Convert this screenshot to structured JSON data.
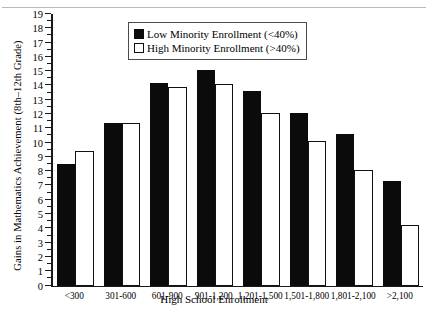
{
  "chart_data": {
    "type": "bar",
    "title": "",
    "xlabel": "High School Enrollment",
    "ylabel": "Gains in Mathematics Achievement (8th–12th Grade)",
    "categories": [
      "<300",
      "301-600",
      "601-900",
      "901-1,200",
      "1,201-1,500",
      "1,501-1,800",
      "1,801-2,100",
      ">2,100"
    ],
    "series": [
      {
        "name": "Low Minority Enrollment  (<40%)",
        "color": "#0b0b0b",
        "values": [
          8.5,
          11.4,
          14.2,
          15.1,
          13.6,
          12.1,
          10.6,
          7.3
        ]
      },
      {
        "name": "High Minority Enrollment (>40%)",
        "color": "#ffffff",
        "values": [
          9.4,
          11.4,
          13.9,
          14.1,
          12.1,
          10.1,
          8.1,
          4.2
        ]
      }
    ],
    "ylim": [
      0,
      19
    ],
    "ytick_labels": [
      "0",
      "1",
      "2",
      "3",
      "4",
      "5",
      "6",
      "7",
      "8",
      "9",
      "10",
      "11",
      "12",
      "13",
      "14",
      "15",
      "16",
      "17",
      "18",
      "19"
    ],
    "ytick_values": [
      0,
      1,
      2,
      3,
      4,
      5,
      6,
      7,
      8,
      9,
      10,
      11,
      12,
      13,
      14,
      15,
      16,
      17,
      18,
      19
    ],
    "yminor_step": 0.5,
    "grid": false,
    "legend_position": "top-center"
  },
  "legend": {
    "entries": [
      {
        "label": "Low Minority Enrollment  (<40%)",
        "swatch": "filled-black-square"
      },
      {
        "label": "High Minority Enrollment (>40%)",
        "swatch": "hollow-white-square"
      }
    ]
  },
  "axes": {
    "x_title": "High School Enrollment",
    "y_title": "Gains in Mathematics Achievement (8th–12th Grade)"
  }
}
